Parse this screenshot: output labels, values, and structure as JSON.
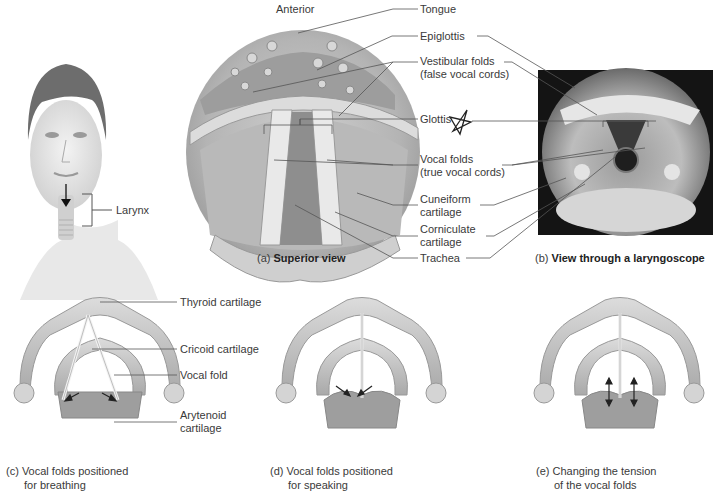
{
  "figure": {
    "orientation_label": "Anterior",
    "face_panel": {
      "label": "Larynx"
    },
    "panel_a": {
      "caption_prefix": "(a)",
      "caption_title": "Superior view"
    },
    "panel_b": {
      "caption_prefix": "(b)",
      "caption_title": "View through a laryngoscope"
    },
    "center_labels": [
      {
        "line1": "Tongue",
        "line2": ""
      },
      {
        "line1": "Epiglottis",
        "line2": ""
      },
      {
        "line1": "Vestibular folds",
        "line2": "(false vocal cords)"
      },
      {
        "line1": "Glottis",
        "line2": ""
      },
      {
        "line1": "Vocal folds",
        "line2": "(true vocal cords)"
      },
      {
        "line1": "Cuneiform",
        "line2": "cartilage"
      },
      {
        "line1": "Corniculate",
        "line2": "cartilage"
      },
      {
        "line1": "Trachea",
        "line2": ""
      }
    ],
    "panel_c": {
      "labels": [
        {
          "line1": "Thyroid cartilage",
          "line2": ""
        },
        {
          "line1": "Cricoid cartilage",
          "line2": ""
        },
        {
          "line1": "Vocal fold",
          "line2": ""
        },
        {
          "line1": "Arytenoid",
          "line2": "cartilage"
        }
      ],
      "caption_prefix": "(c)",
      "caption_line1": "Vocal folds positioned",
      "caption_line2": "for breathing"
    },
    "panel_d": {
      "caption_prefix": "(d)",
      "caption_line1": "Vocal folds positioned",
      "caption_line2": "for speaking"
    },
    "panel_e": {
      "caption_prefix": "(e)",
      "caption_line1": "Changing the tension",
      "caption_line2": "of the vocal folds"
    },
    "annotation_mark": "star-scribble",
    "colors": {
      "line": "#555555",
      "tissue_light": "#d9d9d9",
      "tissue_mid": "#b8b8b8",
      "tissue_dark": "#8f8f8f",
      "photo_bg": "#141414"
    }
  }
}
